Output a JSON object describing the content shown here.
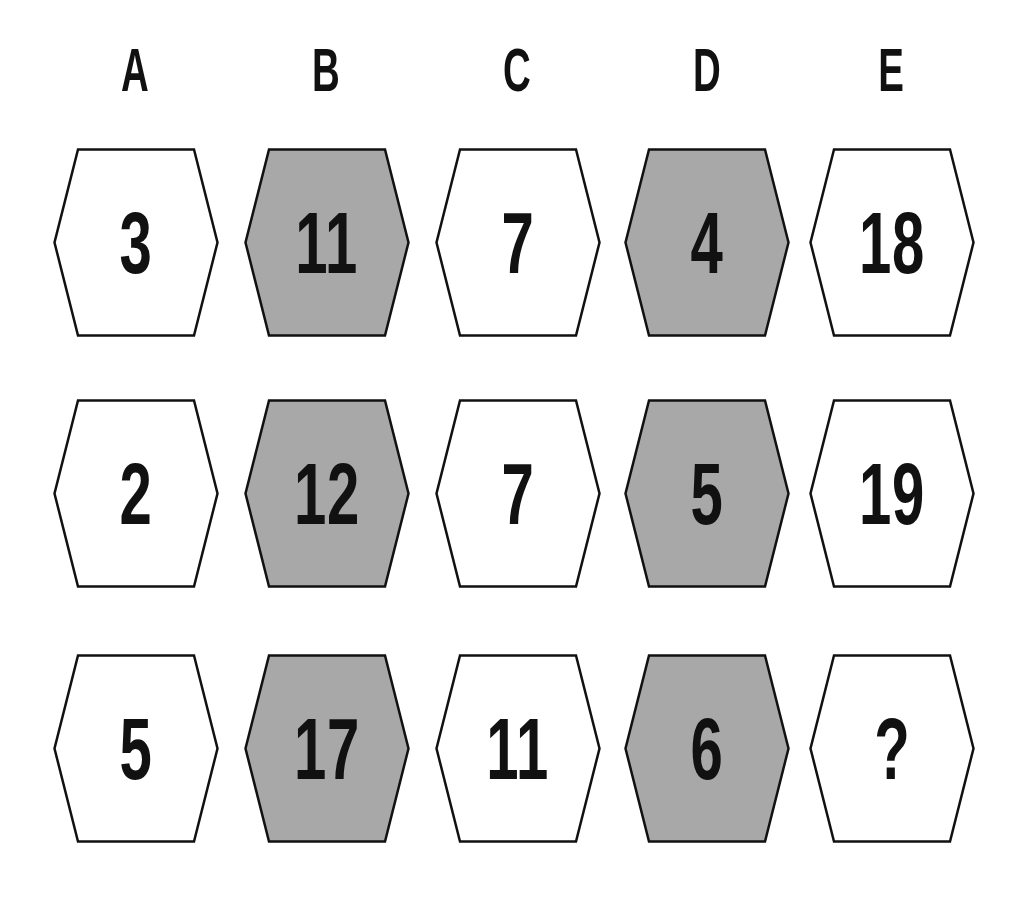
{
  "puzzle": {
    "columns": [
      "A",
      "B",
      "C",
      "D",
      "E"
    ],
    "colors": {
      "white_fill": "#ffffff",
      "shaded_fill": "#a8a8a8",
      "outline": "#111111",
      "text": "#111111"
    },
    "shaded_columns": [
      "B",
      "D"
    ],
    "rows": [
      {
        "cells": [
          "3",
          "11",
          "7",
          "4",
          "18"
        ]
      },
      {
        "cells": [
          "2",
          "12",
          "7",
          "5",
          "19"
        ]
      },
      {
        "cells": [
          "5",
          "17",
          "11",
          "6",
          "?"
        ]
      }
    ]
  }
}
